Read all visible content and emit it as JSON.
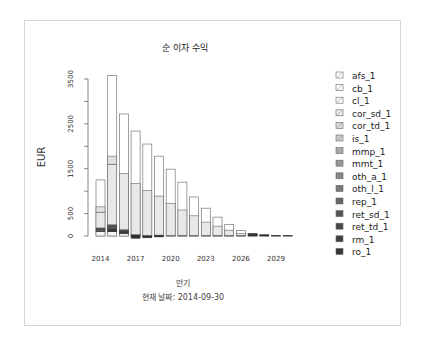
{
  "chart_data": {
    "type": "bar",
    "stacked": true,
    "title": "순 이자 수익",
    "xlabel": "만기",
    "subtitle": "현재 날짜: 2014-09-30",
    "ylabel": "EUR",
    "ylim": [
      0,
      3500
    ],
    "yticks": [
      0,
      500,
      1500,
      2500,
      3500
    ],
    "xticks": [
      "2014",
      "2017",
      "2020",
      "2023",
      "2026",
      "2029"
    ],
    "categories": [
      "2014",
      "2015",
      "2016",
      "2017",
      "2018",
      "2019",
      "2020",
      "2021",
      "2022",
      "2023",
      "2024",
      "2025",
      "2026",
      "2027",
      "2028",
      "2029",
      "2030"
    ],
    "totals": [
      1250,
      3580,
      2720,
      2340,
      2050,
      1780,
      1490,
      1200,
      870,
      620,
      420,
      260,
      120,
      50,
      25,
      10,
      8
    ],
    "series": [
      {
        "name": "afs_1",
        "values": [
          600,
          1800,
          1330,
          1170,
          1040,
          890,
          760,
          620,
          420,
          310,
          200,
          130,
          60,
          0,
          0,
          5,
          4
        ]
      },
      {
        "name": "cb_1",
        "values": [
          0,
          0,
          0,
          0,
          0,
          0,
          0,
          0,
          0,
          0,
          0,
          0,
          0,
          0,
          0,
          0,
          0
        ]
      },
      {
        "name": "cl_1",
        "values": [
          0,
          0,
          0,
          0,
          0,
          0,
          0,
          0,
          0,
          0,
          0,
          0,
          0,
          0,
          0,
          0,
          0
        ]
      },
      {
        "name": "cor_sd_1",
        "values": [
          0,
          0,
          0,
          0,
          0,
          0,
          0,
          0,
          0,
          0,
          0,
          0,
          0,
          0,
          0,
          0,
          0
        ]
      },
      {
        "name": "cor_td_1",
        "values": [
          120,
          180,
          0,
          0,
          0,
          0,
          0,
          0,
          0,
          0,
          0,
          0,
          0,
          0,
          0,
          0,
          0
        ]
      },
      {
        "name": "is_1",
        "values": [
          350,
          1350,
          1250,
          1140,
          1000,
          870,
          720,
          570,
          440,
          300,
          210,
          120,
          50,
          0,
          0,
          0,
          0
        ]
      },
      {
        "name": "mmp_1",
        "values": [
          0,
          0,
          0,
          0,
          0,
          0,
          0,
          0,
          0,
          0,
          0,
          0,
          0,
          0,
          0,
          0,
          0
        ]
      },
      {
        "name": "mmt_1",
        "values": [
          0,
          0,
          0,
          0,
          0,
          0,
          0,
          0,
          0,
          0,
          0,
          0,
          0,
          0,
          0,
          0,
          0
        ]
      },
      {
        "name": "oth_a_1",
        "values": [
          0,
          0,
          0,
          0,
          0,
          0,
          0,
          0,
          0,
          0,
          0,
          0,
          0,
          0,
          0,
          0,
          0
        ]
      },
      {
        "name": "oth_l_1",
        "values": [
          0,
          0,
          0,
          0,
          0,
          0,
          0,
          0,
          0,
          0,
          0,
          0,
          0,
          0,
          0,
          0,
          0
        ]
      },
      {
        "name": "rep_1",
        "values": [
          0,
          0,
          0,
          0,
          0,
          0,
          0,
          0,
          0,
          0,
          0,
          0,
          0,
          0,
          0,
          0,
          0
        ]
      },
      {
        "name": "ret_sd_1",
        "values": [
          80,
          100,
          40,
          0,
          0,
          0,
          0,
          0,
          0,
          0,
          0,
          0,
          0,
          0,
          0,
          0,
          0
        ]
      },
      {
        "name": "ret_td_1",
        "values": [
          0,
          50,
          40,
          30,
          10,
          20,
          10,
          10,
          10,
          10,
          10,
          10,
          10,
          50,
          25,
          5,
          4
        ]
      },
      {
        "name": "rm_1",
        "values": [
          0,
          0,
          0,
          0,
          0,
          0,
          0,
          0,
          0,
          0,
          0,
          0,
          0,
          0,
          0,
          0,
          0
        ]
      },
      {
        "name": "ro_1",
        "values": [
          100,
          100,
          60,
          0,
          0,
          0,
          0,
          0,
          0,
          0,
          0,
          0,
          0,
          0,
          0,
          0,
          0
        ]
      }
    ],
    "negative_values": {
      "2017": -50,
      "2018": -40,
      "2019": -20
    },
    "legend_position": "right",
    "grid": false
  },
  "legend": [
    "afs_1",
    "cb_1",
    "cl_1",
    "cor_sd_1",
    "cor_td_1",
    "is_1",
    "mmp_1",
    "mmt_1",
    "oth_a_1",
    "oth_l_1",
    "rep_1",
    "ret_sd_1",
    "ret_td_1",
    "rm_1",
    "ro_1"
  ]
}
